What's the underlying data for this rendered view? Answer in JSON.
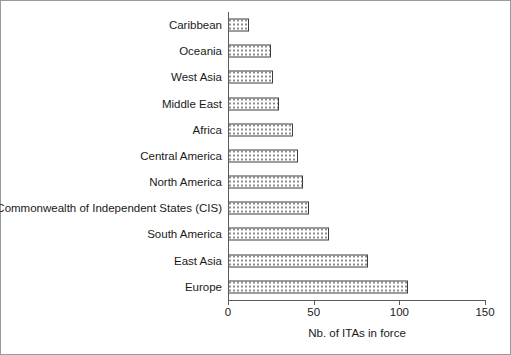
{
  "chart_data": {
    "type": "bar",
    "orientation": "horizontal",
    "title": "",
    "xlabel": "Nb. of ITAs in force",
    "ylabel": "Regional breakdown",
    "xlim": [
      0,
      150
    ],
    "xticks": [
      0,
      50,
      100,
      150
    ],
    "grid": false,
    "legend": null,
    "categories": [
      "Caribbean",
      "Oceania",
      "West Asia",
      "Middle East",
      "Africa",
      "Central America",
      "North America",
      "Commonwealth of Independent States (CIS)",
      "South America",
      "East Asia",
      "Europe"
    ],
    "values": [
      12,
      25,
      26,
      30,
      38,
      41,
      44,
      47,
      59,
      82,
      105
    ],
    "bar_style": {
      "fill": "#ffffff",
      "pattern": "dotted",
      "pattern_color": "#8e8e8e",
      "border": "#3c3c3c"
    }
  },
  "axis": {
    "x_tick_labels": [
      "0",
      "50",
      "100",
      "150"
    ]
  }
}
